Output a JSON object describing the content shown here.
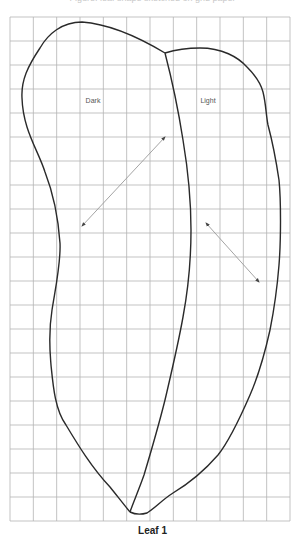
{
  "figure": {
    "top_caption": "Figure: leaf shape sketched on grid paper",
    "bottom_label": "Leaf 1",
    "regions": [
      {
        "label": "Dark",
        "x": 93,
        "y": 103
      },
      {
        "label": "Light",
        "x": 208,
        "y": 103
      }
    ],
    "grid": {
      "left": 10,
      "top": 17,
      "right": 290,
      "bottom": 521,
      "columns": 12,
      "rows": 21,
      "color": "#b4b4b4"
    },
    "outline_color": "#2a2a2a",
    "arrow_color": "#9a9a9a",
    "arrows": [
      {
        "name": "dark-width-arrow",
        "x1": 82,
        "y1": 226,
        "x2": 165,
        "y2": 137
      },
      {
        "name": "light-width-arrow",
        "x1": 206,
        "y1": 223,
        "x2": 259,
        "y2": 282
      }
    ]
  }
}
